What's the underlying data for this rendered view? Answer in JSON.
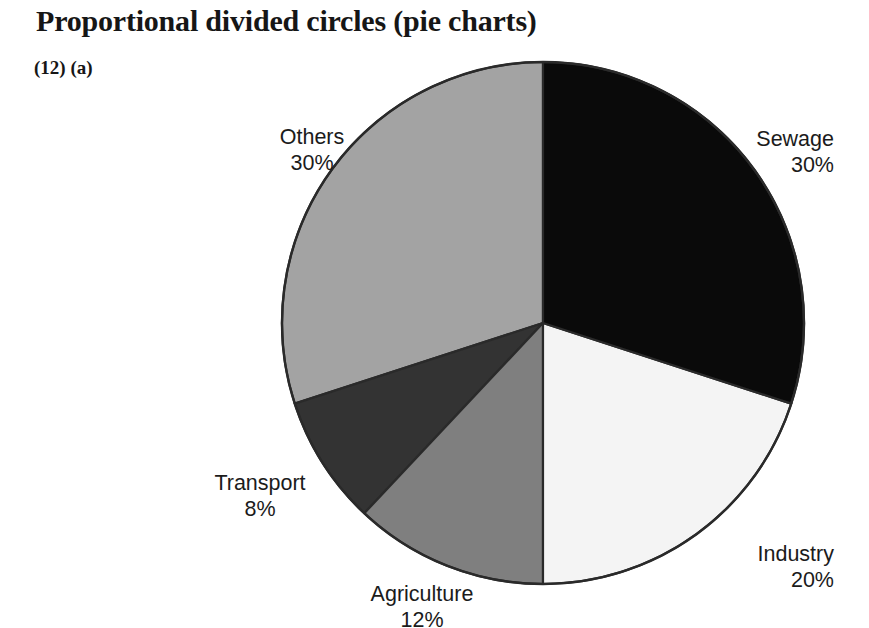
{
  "figure": {
    "title": "Proportional divided circles (pie charts)",
    "subtitle": "(12) (a)"
  },
  "labels": {
    "sewage": {
      "name": "Sewage",
      "pct": "30%"
    },
    "industry": {
      "name": "Industry",
      "pct": "20%"
    },
    "agriculture": {
      "name": "Agriculture",
      "pct": "12%"
    },
    "transport": {
      "name": "Transport",
      "pct": "8%"
    },
    "others": {
      "name": "Others",
      "pct": "30%"
    }
  },
  "chart_data": {
    "type": "pie",
    "title": "Proportional divided circles (pie charts)",
    "subtitle": "(12) (a)",
    "xlabel": "",
    "ylabel": "",
    "units": "percent",
    "total": 100,
    "start_angle_deg": 0,
    "direction": "clockwise",
    "legend": "none",
    "labels_position": "outside",
    "grid": false,
    "categories": [
      "Sewage",
      "Industry",
      "Agriculture",
      "Transport",
      "Others"
    ],
    "values": [
      30,
      20,
      12,
      8,
      30
    ],
    "value_labels": [
      "30%",
      "20%",
      "12%",
      "8%",
      "30%"
    ],
    "colors": [
      "#0a0a0a",
      "#f4f4f4",
      "#7f7f7f",
      "#333333",
      "#a3a3a3"
    ],
    "slices": [
      {
        "label": "Sewage",
        "value": 30,
        "value_label": "30%",
        "color": "#0a0a0a",
        "start_deg": 0,
        "end_deg": 108
      },
      {
        "label": "Industry",
        "value": 20,
        "value_label": "20%",
        "color": "#f4f4f4",
        "start_deg": 108,
        "end_deg": 180
      },
      {
        "label": "Agriculture",
        "value": 12,
        "value_label": "12%",
        "color": "#7f7f7f",
        "start_deg": 180,
        "end_deg": 223.2
      },
      {
        "label": "Transport",
        "value": 8,
        "value_label": "8%",
        "color": "#333333",
        "start_deg": 223.2,
        "end_deg": 252
      },
      {
        "label": "Others",
        "value": 30,
        "value_label": "30%",
        "color": "#a3a3a3",
        "start_deg": 252,
        "end_deg": 360
      }
    ],
    "geometry": {
      "center_x": 543,
      "center_y": 323,
      "radius": 261
    }
  },
  "colors": {
    "sewage": "#0a0a0a",
    "industry": "#f4f4f4",
    "agriculture": "#7f7f7f",
    "transport": "#333333",
    "others": "#a3a3a3",
    "outline": "#2a2a2a",
    "text": "#1b1b1b",
    "background": "#ffffff"
  }
}
